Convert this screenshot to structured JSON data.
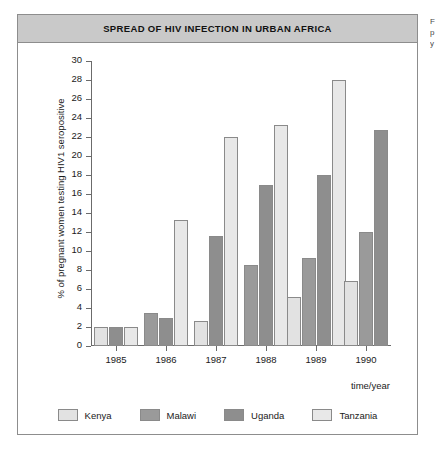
{
  "card": {
    "title": "SPREAD OF HIV INFECTION IN URBAN AFRICA"
  },
  "margin_notes": {
    "line1": "F",
    "line2": "p",
    "line3": "y"
  },
  "chart_data": {
    "type": "bar",
    "title": "SPREAD OF HIV INFECTION IN URBAN AFRICA",
    "xlabel": "time/year",
    "ylabel": "% of pregnant women testing HIV1 seropositive",
    "categories": [
      "1985",
      "1986",
      "1987",
      "1988",
      "1989",
      "1990"
    ],
    "ylim": [
      0,
      30
    ],
    "ytick_step": 2,
    "yticks": [
      "0",
      "2",
      "4",
      "6",
      "8",
      "10",
      "12",
      "14",
      "16",
      "18",
      "20",
      "22",
      "24",
      "26",
      "28",
      "30"
    ],
    "grid": false,
    "legend_position": "bottom",
    "series": [
      {
        "name": "Kenya",
        "color": "#e2e2e2",
        "values": [
          2.0,
          null,
          2.6,
          null,
          5.2,
          6.8
        ]
      },
      {
        "name": "Malawi",
        "color": "#9a9a9a",
        "values": [
          null,
          3.5,
          null,
          8.5,
          9.3,
          12.0
        ]
      },
      {
        "name": "Uganda",
        "color": "#8e8e8e",
        "values": [
          2.0,
          3.0,
          11.6,
          17.0,
          18.0,
          22.7
        ]
      },
      {
        "name": "Tanzania",
        "color": "#e8e8e8",
        "values": [
          2.0,
          13.3,
          22.0,
          23.3,
          28.0,
          null
        ]
      }
    ]
  }
}
